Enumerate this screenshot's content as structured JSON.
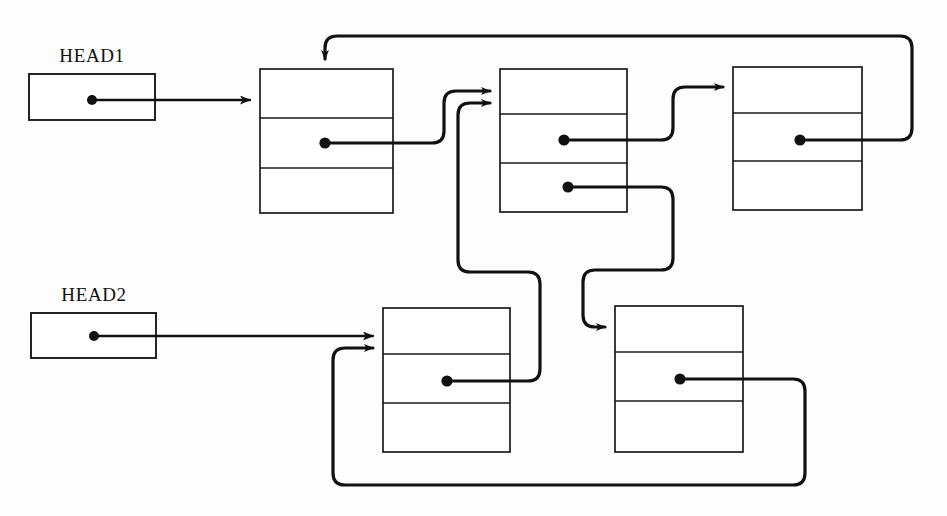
{
  "figure": {
    "type": "linked-list-diagram",
    "title": "",
    "background_color": "#fdfdfd",
    "line_color": "#111111",
    "box_fill": "#ffffff"
  },
  "heads": [
    {
      "id": "head1",
      "label": "HEAD1",
      "label_x": 92,
      "label_y": 62,
      "box": {
        "x": 29,
        "y": 74,
        "w": 126,
        "h": 46
      },
      "dot": {
        "x": 92,
        "y": 100
      },
      "points_to": "node1"
    },
    {
      "id": "head2",
      "label": "HEAD2",
      "label_x": 94,
      "label_y": 301,
      "box": {
        "x": 31,
        "y": 313,
        "w": 125,
        "h": 45
      },
      "dot": {
        "x": 94,
        "y": 336
      },
      "points_to": "node4"
    }
  ],
  "nodes": [
    {
      "id": "node1",
      "box": {
        "x": 260,
        "y": 69,
        "w": 133,
        "h": 144
      },
      "dividers_y": [
        118,
        168
      ],
      "pointers": [
        {
          "row": 2,
          "dot": {
            "x": 325,
            "y": 143
          },
          "target": "node2"
        }
      ]
    },
    {
      "id": "node2",
      "box": {
        "x": 500,
        "y": 69,
        "w": 127,
        "h": 143
      },
      "dividers_y": [
        114,
        163
      ],
      "pointers": [
        {
          "row": 2,
          "dot": {
            "x": 564,
            "y": 140
          },
          "target": "node3"
        },
        {
          "row": 3,
          "dot": {
            "x": 568,
            "y": 187
          },
          "target": "node5"
        }
      ]
    },
    {
      "id": "node3",
      "box": {
        "x": 733,
        "y": 67,
        "w": 129,
        "h": 143
      },
      "dividers_y": [
        113,
        161
      ],
      "pointers": [
        {
          "row": 2,
          "dot": {
            "x": 800,
            "y": 140
          },
          "target": "node1"
        }
      ]
    },
    {
      "id": "node4",
      "box": {
        "x": 383,
        "y": 308,
        "w": 127,
        "h": 144
      },
      "dividers_y": [
        354,
        403
      ],
      "pointers": [
        {
          "row": 2,
          "dot": {
            "x": 447,
            "y": 381
          },
          "target": "node2"
        }
      ]
    },
    {
      "id": "node5",
      "box": {
        "x": 615,
        "y": 306,
        "w": 128,
        "h": 146
      },
      "dividers_y": [
        352,
        401
      ],
      "pointers": [
        {
          "row": 2,
          "dot": {
            "x": 680,
            "y": 379
          },
          "target": "node4"
        }
      ]
    }
  ],
  "edges": [
    {
      "id": "edge-head1-node1",
      "from": "head1",
      "to": "node1",
      "arrow": true
    },
    {
      "id": "edge-head2-node4",
      "from": "head2",
      "to": "node4",
      "arrow": true
    },
    {
      "id": "edge-node1-node2",
      "from": "node1",
      "to": "node2",
      "arrow": true
    },
    {
      "id": "edge-node2-node3",
      "from": "node2",
      "to": "node3",
      "arrow": true
    },
    {
      "id": "edge-node3-node1",
      "from": "node3",
      "to": "node1",
      "arrow": true
    },
    {
      "id": "edge-node2-node5",
      "from": "node2",
      "to": "node5",
      "arrow": true
    },
    {
      "id": "edge-node4-node2",
      "from": "node4",
      "to": "node2",
      "arrow": true
    },
    {
      "id": "edge-node5-node4",
      "from": "node5",
      "to": "node4",
      "arrow": true
    }
  ]
}
